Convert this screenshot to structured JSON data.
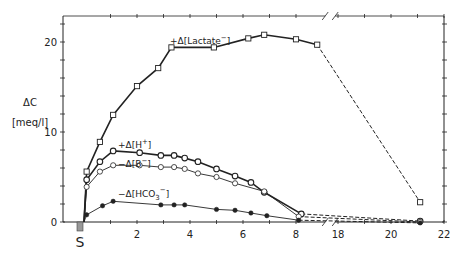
{
  "chart_data": {
    "type": "line",
    "title": "",
    "xlabel": "",
    "ylabel": "ΔC [meq/l]",
    "ylabel_line1": "ΔC",
    "ylabel_line2": "[meq/l]",
    "xlim": [
      0,
      22
    ],
    "ylim": [
      0,
      23
    ],
    "x_axis_break": [
      8.8,
      17.5
    ],
    "x_ticks": [
      "2",
      "4",
      "6",
      "8",
      "18",
      "20",
      "22"
    ],
    "y_ticks": [
      "0",
      "10",
      "20"
    ],
    "start_marker_label": "S",
    "grid": false,
    "legend_position": "inline labels",
    "series": [
      {
        "name": "+Δ[Lactate⁻]",
        "label_prefix": "+Δ",
        "label_body": "Lactate",
        "label_sup": "−",
        "label_sub": "",
        "marker": "open-square",
        "line_width": 1.6,
        "x": [
          0,
          0.1,
          0.6,
          1.1,
          2.0,
          2.8,
          3.3,
          4.9,
          6.2,
          6.8,
          8.0,
          8.8,
          21.1
        ],
        "values": [
          0,
          5.6,
          8.9,
          11.9,
          15.1,
          17.1,
          19.4,
          19.4,
          20.4,
          20.8,
          20.3,
          19.7,
          2.2
        ],
        "dashed_from_index": 11
      },
      {
        "name": "+Δ[H⁺]",
        "label_prefix": "+Δ",
        "label_body": "H",
        "label_sup": "+",
        "label_sub": "",
        "marker": "open-circle-thick",
        "line_width": 1.6,
        "x": [
          0,
          0.1,
          0.6,
          1.1,
          2.1,
          2.9,
          3.4,
          3.8,
          4.3,
          5.0,
          5.7,
          6.3,
          6.8,
          8.2,
          21.1
        ],
        "values": [
          0,
          4.7,
          6.7,
          7.9,
          7.7,
          7.4,
          7.4,
          7.1,
          6.7,
          5.9,
          5.1,
          4.4,
          3.3,
          0.9,
          0.1
        ],
        "dashed_from_index": 13
      },
      {
        "name": "−Δ[B⁻]",
        "label_prefix": "−Δ",
        "label_body": "B",
        "label_sup": "−",
        "label_sub": "",
        "marker": "open-circle",
        "line_width": 0.9,
        "x": [
          0,
          0.1,
          0.6,
          1.1,
          2.1,
          2.9,
          3.4,
          3.8,
          4.3,
          5.0,
          5.7,
          6.8,
          8.1,
          21.1
        ],
        "values": [
          0,
          3.9,
          5.6,
          6.3,
          6.3,
          6.1,
          6.1,
          5.9,
          5.4,
          5.0,
          4.3,
          3.4,
          0.6,
          0.0
        ],
        "dashed_from_index": 12
      },
      {
        "name": "−Δ[HCO₃⁻]",
        "label_prefix": "−Δ",
        "label_body": "HCO",
        "label_sup": "−",
        "label_sub": "3",
        "marker": "filled-circle",
        "line_width": 0.9,
        "x": [
          0,
          0.1,
          0.7,
          1.1,
          2.9,
          3.4,
          3.8,
          5.0,
          5.7,
          6.3,
          6.9,
          8.1,
          21.1
        ],
        "values": [
          0,
          0.8,
          1.8,
          2.3,
          1.9,
          1.9,
          1.9,
          1.4,
          1.3,
          1.0,
          0.7,
          0.2,
          -0.1
        ],
        "dashed_from_index": 11
      }
    ]
  }
}
